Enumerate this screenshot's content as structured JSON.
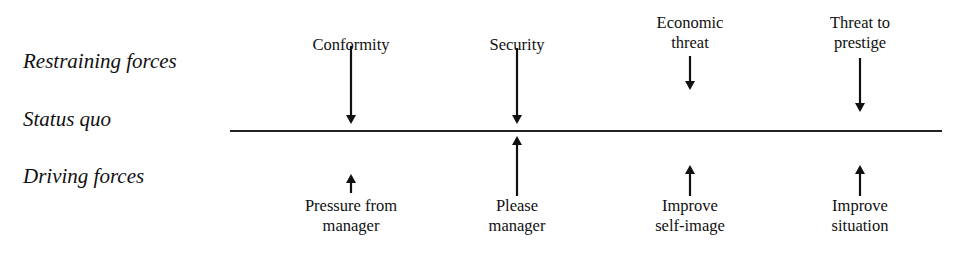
{
  "diagram": {
    "type": "force-field-analysis",
    "row_labels": {
      "restraining": "Restraining forces",
      "status_quo": "Status quo",
      "driving": "Driving forces"
    },
    "restraining_forces": [
      {
        "label": "Conformity",
        "x": 351,
        "arrow_top": 46,
        "arrow_bottom": 124
      },
      {
        "label": "Security",
        "x": 517,
        "arrow_top": 48,
        "arrow_bottom": 124
      },
      {
        "label": "Economic\nthreat",
        "x": 690,
        "arrow_top": 56,
        "arrow_bottom": 90
      },
      {
        "label": "Threat to\nprestige",
        "x": 860,
        "arrow_top": 58,
        "arrow_bottom": 112
      }
    ],
    "driving_forces": [
      {
        "label": "Pressure from\nmanager",
        "x": 351,
        "arrow_top": 174,
        "arrow_bottom": 193
      },
      {
        "label": "Please\nmanager",
        "x": 517,
        "arrow_top": 136,
        "arrow_bottom": 196
      },
      {
        "label": "Improve\nself-image",
        "x": 690,
        "arrow_top": 165,
        "arrow_bottom": 196
      },
      {
        "label": "Improve\nsituation",
        "x": 860,
        "arrow_top": 165,
        "arrow_bottom": 196
      }
    ],
    "colors": {
      "ink": "#111111",
      "background": "#ffffff"
    }
  }
}
